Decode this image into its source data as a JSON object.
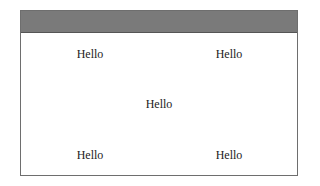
{
  "window": {
    "titlebar_color": "#7a7a7a",
    "labels": [
      {
        "text": "Hello",
        "position": "top-left"
      },
      {
        "text": "Hello",
        "position": "top-right"
      },
      {
        "text": "Hello",
        "position": "center"
      },
      {
        "text": "Hello",
        "position": "bottom-left"
      },
      {
        "text": "Hello",
        "position": "bottom-right"
      }
    ]
  }
}
